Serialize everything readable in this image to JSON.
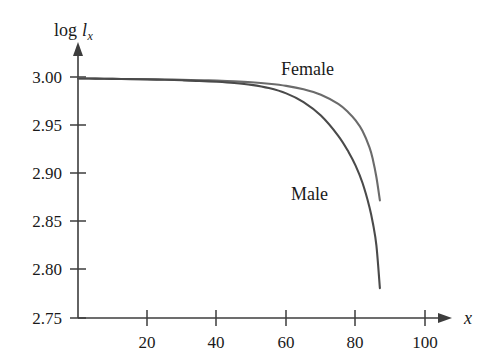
{
  "figure": {
    "title": "",
    "background_color": "#ffffff",
    "width": 496,
    "height": 363
  },
  "axes": {
    "y_axis_label": "log",
    "y_axis_label_symbol": "l",
    "y_axis_label_subscript": "x",
    "x_axis_label": "x",
    "axis_color": "#3d3d3d"
  },
  "labels": {
    "female": "Female",
    "male": "Male"
  },
  "ticks": {
    "x": [
      "20",
      "40",
      "60",
      "80",
      "100"
    ],
    "y": [
      "3.00",
      "2.95",
      "2.90",
      "2.85",
      "2.80",
      "2.75"
    ]
  },
  "chart_data": {
    "type": "line",
    "title": "",
    "xlabel": "x",
    "ylabel": "log l_x",
    "xlim": [
      0,
      104
    ],
    "ylim": [
      2.75,
      3.005
    ],
    "grid": false,
    "legend": "inline-annotations",
    "xticks": [
      20,
      40,
      60,
      80,
      100
    ],
    "yticks": [
      3.0,
      2.95,
      2.9,
      2.85,
      2.8,
      2.75
    ],
    "colors": {
      "female": "#6b6b6b",
      "male": "#4a4a4a"
    },
    "series": [
      {
        "name": "Female",
        "color": "#6b6b6b",
        "x": [
          0,
          5,
          10,
          15,
          20,
          25,
          30,
          35,
          40,
          45,
          50,
          55,
          60,
          65,
          70,
          75,
          78,
          80,
          82,
          84,
          85,
          86,
          87
        ],
        "values": [
          2.9985,
          2.9983,
          2.9981,
          2.9979,
          2.9977,
          2.9974,
          2.9971,
          2.9967,
          2.9962,
          2.9955,
          2.9945,
          2.993,
          2.9908,
          2.9872,
          2.9815,
          2.972,
          2.963,
          2.955,
          2.944,
          2.927,
          2.914,
          2.896,
          2.872
        ]
      },
      {
        "name": "Male",
        "color": "#4a4a4a",
        "x": [
          0,
          5,
          10,
          15,
          20,
          25,
          30,
          35,
          40,
          45,
          50,
          55,
          60,
          65,
          70,
          75,
          78,
          80,
          82,
          84,
          85,
          86,
          87
        ],
        "values": [
          2.9985,
          2.9983,
          2.9981,
          2.9978,
          2.9975,
          2.9971,
          2.9966,
          2.996,
          2.9951,
          2.9938,
          2.9918,
          2.9885,
          2.983,
          2.974,
          2.96,
          2.939,
          2.922,
          2.908,
          2.89,
          2.865,
          2.848,
          2.825,
          2.781
        ]
      }
    ]
  }
}
